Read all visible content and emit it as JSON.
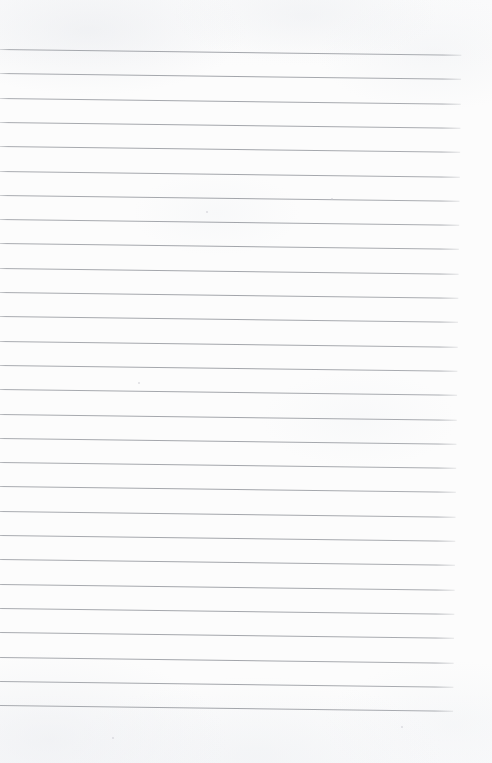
{
  "document": {
    "kind": "scanned-lined-notebook-page",
    "title": "Blank Ruled Notebook Page",
    "width_px": 492,
    "height_px": 763,
    "page_background_color": "#fcfcfc",
    "has_visible_text": false,
    "has_handwriting": false,
    "has_margin_rule": false,
    "has_page_border": false,
    "body_text": ""
  },
  "ruling": {
    "line_count": 28,
    "line_color": "#96999f",
    "line_thickness_px": 1,
    "first_line_y": 49,
    "last_line_y": 705,
    "line_spacing_px": 24.3,
    "line_start_x": 0,
    "line_end_x": 462,
    "skew_degrees": 0.72,
    "top_margin_px": 49,
    "bottom_margin_px": 58,
    "right_margin_px": 30
  },
  "specks": [
    {
      "x": 206,
      "y": 211,
      "size": 2
    },
    {
      "x": 138,
      "y": 382,
      "size": 2
    },
    {
      "x": 112,
      "y": 737,
      "size": 2
    },
    {
      "x": 401,
      "y": 726,
      "size": 2
    },
    {
      "x": 331,
      "y": 198,
      "size": 2
    }
  ]
}
